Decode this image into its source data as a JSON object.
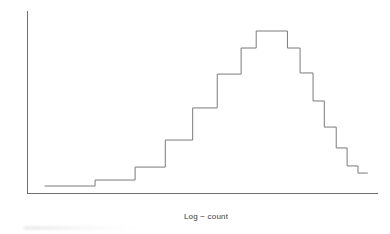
{
  "figure": {
    "background": "#ffffff",
    "line_color": "#7a7a7a",
    "axis_color": "#6e6e6e",
    "text_color": "#3a3a3a"
  },
  "axes": {
    "ylabel": "Probability",
    "xlabel": "Log − count"
  },
  "chart_data": {
    "type": "line",
    "title": "",
    "xlabel": "Log − count",
    "ylabel": "Probability",
    "subtitle": "",
    "grid": false,
    "legend": null,
    "legend_position": "none",
    "axis_ticks": {
      "x": [],
      "y": []
    },
    "xlim": [
      0,
      1
    ],
    "ylim": [
      0,
      1
    ],
    "note": "Step histogram (probability density of log-count) drawn as a staircase outline with no tick labels. Values are normalized heights where 0 = x-axis baseline and 1.0 = peak of the distribution.",
    "series": [
      {
        "name": "Log-count probability distribution",
        "style": "step-post",
        "bin_edges": [
          0.05,
          0.194,
          0.308,
          0.394,
          0.472,
          0.542,
          0.61,
          0.653,
          0.742,
          0.778,
          0.815,
          0.847,
          0.881,
          0.912,
          0.943,
          0.971
        ],
        "values": [
          0.043,
          0.08,
          0.16,
          0.327,
          0.525,
          0.734,
          0.895,
          1.0,
          0.895,
          0.741,
          0.568,
          0.407,
          0.278,
          0.167,
          0.123
        ]
      }
    ],
    "points": [
      {
        "x": 0.05,
        "y": 0.043
      },
      {
        "x": 0.194,
        "y": 0.043
      },
      {
        "x": 0.194,
        "y": 0.08
      },
      {
        "x": 0.308,
        "y": 0.08
      },
      {
        "x": 0.308,
        "y": 0.16
      },
      {
        "x": 0.394,
        "y": 0.16
      },
      {
        "x": 0.394,
        "y": 0.327
      },
      {
        "x": 0.472,
        "y": 0.327
      },
      {
        "x": 0.472,
        "y": 0.525
      },
      {
        "x": 0.542,
        "y": 0.525
      },
      {
        "x": 0.542,
        "y": 0.734
      },
      {
        "x": 0.61,
        "y": 0.734
      },
      {
        "x": 0.61,
        "y": 0.895
      },
      {
        "x": 0.653,
        "y": 0.895
      },
      {
        "x": 0.653,
        "y": 1.0
      },
      {
        "x": 0.742,
        "y": 1.0
      },
      {
        "x": 0.742,
        "y": 0.895
      },
      {
        "x": 0.778,
        "y": 0.895
      },
      {
        "x": 0.778,
        "y": 0.741
      },
      {
        "x": 0.815,
        "y": 0.741
      },
      {
        "x": 0.815,
        "y": 0.568
      },
      {
        "x": 0.847,
        "y": 0.568
      },
      {
        "x": 0.847,
        "y": 0.407
      },
      {
        "x": 0.881,
        "y": 0.407
      },
      {
        "x": 0.881,
        "y": 0.278
      },
      {
        "x": 0.912,
        "y": 0.278
      },
      {
        "x": 0.912,
        "y": 0.167
      },
      {
        "x": 0.943,
        "y": 0.167
      },
      {
        "x": 0.943,
        "y": 0.123
      },
      {
        "x": 0.971,
        "y": 0.123
      }
    ]
  }
}
